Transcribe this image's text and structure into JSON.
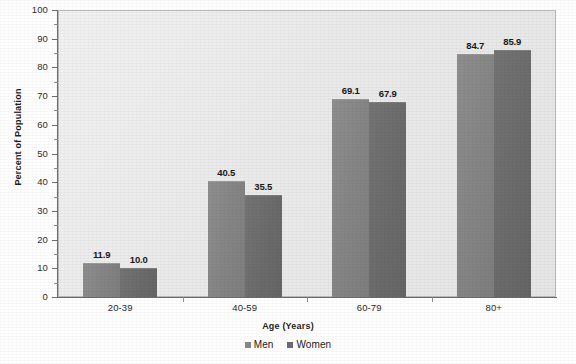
{
  "chart_data": {
    "type": "bar",
    "title": "",
    "subtitle": "",
    "xlabel": "Age (Years)",
    "ylabel": "Percent of Population",
    "categories": [
      "20-39",
      "40-59",
      "60-79",
      "80+"
    ],
    "series": [
      {
        "name": "Men",
        "values": [
          11.9,
          40.5,
          69.1,
          84.7
        ],
        "color": "#858585"
      },
      {
        "name": "Women",
        "values": [
          10.0,
          35.5,
          67.9,
          85.9
        ],
        "color": "#6b6b6b"
      }
    ],
    "value_labels": [
      [
        "11.9",
        "10.0"
      ],
      [
        "40.5",
        "35.5"
      ],
      [
        "69.1",
        "67.9"
      ],
      [
        "84.7",
        "85.9"
      ]
    ],
    "ylim": [
      0,
      100
    ],
    "ytick_step": 10,
    "yminor_step": 5,
    "ytick_labels": [
      "100",
      "90",
      "80",
      "70",
      "60",
      "50",
      "40",
      "30",
      "20",
      "10",
      "0"
    ],
    "grid": false,
    "legend_position": "bottom-center",
    "plot_background": "#ebebeb",
    "axis_color": "#6d6d6d"
  },
  "legend": {
    "items": [
      {
        "label": "Men",
        "marker": "square-marker"
      },
      {
        "label": "Women",
        "marker": "square-marker"
      }
    ]
  }
}
